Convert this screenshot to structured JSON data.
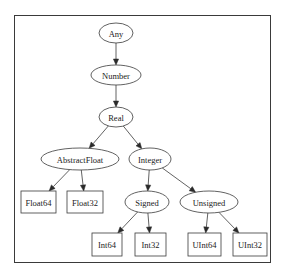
{
  "diagram": {
    "type": "type-hierarchy-tree",
    "nodes": [
      {
        "id": "Any",
        "label": "Any",
        "shape": "ellipse",
        "cx": 116,
        "cy": 33,
        "rx": 17,
        "ry": 10
      },
      {
        "id": "Number",
        "label": "Number",
        "shape": "ellipse",
        "cx": 116,
        "cy": 75,
        "rx": 25,
        "ry": 10
      },
      {
        "id": "Real",
        "label": "Real",
        "shape": "ellipse",
        "cx": 116,
        "cy": 117,
        "rx": 17,
        "ry": 10
      },
      {
        "id": "AbstractFloat",
        "label": "AbstractFloat",
        "shape": "ellipse",
        "cx": 80,
        "cy": 159,
        "rx": 39,
        "ry": 11
      },
      {
        "id": "Integer",
        "label": "Integer",
        "shape": "ellipse",
        "cx": 150,
        "cy": 159,
        "rx": 21,
        "ry": 11
      },
      {
        "id": "Float64",
        "label": "Float64",
        "shape": "box",
        "x": 21,
        "y": 191,
        "w": 35,
        "h": 22
      },
      {
        "id": "Float32",
        "label": "Float32",
        "shape": "box",
        "x": 67,
        "y": 191,
        "w": 36,
        "h": 22
      },
      {
        "id": "Signed",
        "label": "Signed",
        "shape": "ellipse",
        "cx": 147,
        "cy": 202,
        "rx": 22,
        "ry": 11
      },
      {
        "id": "Unsigned",
        "label": "Unsigned",
        "shape": "ellipse",
        "cx": 209,
        "cy": 202,
        "rx": 29,
        "ry": 11
      },
      {
        "id": "Int64",
        "label": "Int64",
        "shape": "box",
        "x": 92,
        "y": 233,
        "w": 30,
        "h": 23
      },
      {
        "id": "Int32",
        "label": "Int32",
        "shape": "box",
        "x": 135,
        "y": 233,
        "w": 31,
        "h": 23
      },
      {
        "id": "UInt64",
        "label": "UInt64",
        "shape": "box",
        "x": 188,
        "y": 233,
        "w": 33,
        "h": 23
      },
      {
        "id": "UInt32",
        "label": "UInt32",
        "shape": "box",
        "x": 233,
        "y": 233,
        "w": 34,
        "h": 23
      }
    ],
    "edges": [
      {
        "from": "Any",
        "to": "Number"
      },
      {
        "from": "Number",
        "to": "Real"
      },
      {
        "from": "Real",
        "to": "AbstractFloat"
      },
      {
        "from": "Real",
        "to": "Integer"
      },
      {
        "from": "AbstractFloat",
        "to": "Float64"
      },
      {
        "from": "AbstractFloat",
        "to": "Float32"
      },
      {
        "from": "Integer",
        "to": "Signed"
      },
      {
        "from": "Integer",
        "to": "Unsigned"
      },
      {
        "from": "Signed",
        "to": "Int64"
      },
      {
        "from": "Signed",
        "to": "Int32"
      },
      {
        "from": "Unsigned",
        "to": "UInt64"
      },
      {
        "from": "Unsigned",
        "to": "UInt32"
      }
    ]
  }
}
